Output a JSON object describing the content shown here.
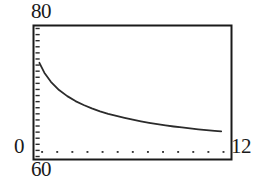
{
  "figure": {
    "name": "decay-curve-graph",
    "background_color": "#ffffff",
    "frame_color": "#1a1a1a",
    "curve_color": "#2b2b2b"
  },
  "labels": {
    "y_max": "80",
    "y_zero": "0",
    "x_min_secondary": "60",
    "x_max": "12"
  },
  "chart_data": {
    "type": "line",
    "title": "",
    "xlabel": "",
    "ylabel": "",
    "xlim": [
      0,
      12
    ],
    "ylim": [
      0,
      80
    ],
    "grid": false,
    "legend": null,
    "axis_labels_shown": {
      "y_top": "80",
      "y_bottom": "0",
      "x_right": "12",
      "x_left_secondary": "60"
    },
    "x_tick_style": "dotted-marks",
    "x_tick_count": 13,
    "y_tick_style": "small-dashes-inside-axis",
    "y_tick_count": 22,
    "series": [
      {
        "name": "decay",
        "x": [
          0.3,
          0.6,
          1.0,
          1.5,
          2.0,
          2.5,
          3.0,
          3.5,
          4.0,
          4.5,
          5.0,
          5.5,
          6.0,
          6.5,
          7.0,
          7.5,
          8.0,
          8.5,
          9.0,
          9.5,
          10.0,
          10.5,
          11.0,
          11.4
        ],
        "y": [
          58.0,
          52.0,
          46.5,
          41.5,
          37.8,
          34.8,
          32.4,
          30.4,
          28.6,
          27.1,
          25.8,
          24.6,
          23.5,
          22.5,
          21.6,
          20.8,
          20.1,
          19.4,
          18.8,
          18.2,
          17.7,
          17.2,
          16.8,
          16.4
        ]
      }
    ]
  }
}
